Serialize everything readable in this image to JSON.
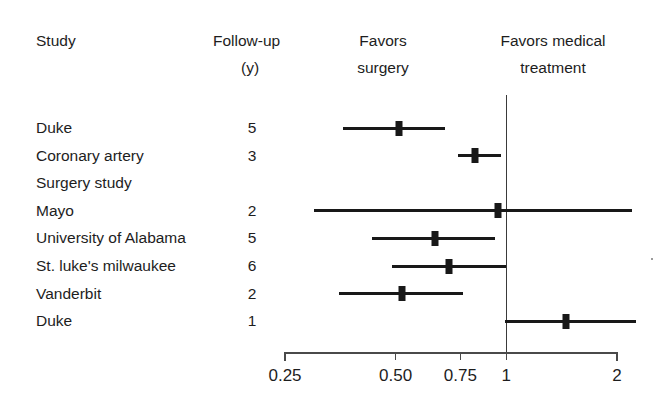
{
  "figure": {
    "title": "",
    "background_color": "#ffffff",
    "ink_color": "#181818"
  },
  "headers": {
    "study": "Study",
    "followup_line1": "Follow-up",
    "followup_line2": "(y)",
    "favors_surgery_line1": "Favors",
    "favors_surgery_line2": "surgery",
    "favors_medical_line1": "Favors medical",
    "favors_medical_line2": "treatment"
  },
  "chart_data": {
    "type": "forest",
    "title": "",
    "xlabel": "",
    "ylabel": "",
    "xscale": "log",
    "xlim": [
      0.25,
      2
    ],
    "grid": false,
    "reference_line": 1,
    "legend_position": "top",
    "left_annotation": "Favors surgery",
    "right_annotation": "Favors medical treatment",
    "xticks": [
      0.25,
      0.5,
      0.75,
      1,
      2
    ],
    "xticklabels": [
      "0.25",
      "0.50",
      "0.75",
      "1",
      "2"
    ],
    "columns": [
      "Study",
      "Follow-up (y)"
    ],
    "rows": [
      {
        "study": "Duke",
        "study_continuation": "",
        "followup": "5",
        "estimate": 0.51,
        "ci_low": 0.36,
        "ci_high": 0.68,
        "clipped_low": false,
        "clipped_high": false
      },
      {
        "study": "Coronary artery",
        "study_continuation": "Surgery study",
        "followup": "3",
        "estimate": 0.82,
        "ci_low": 0.74,
        "ci_high": 0.97,
        "clipped_low": false,
        "clipped_high": false
      },
      {
        "study": "Mayo",
        "study_continuation": "",
        "followup": "2",
        "estimate": 0.95,
        "ci_low": 0.3,
        "ci_high": 2.2,
        "clipped_low": true,
        "clipped_high": true
      },
      {
        "study": "University of Alabama",
        "study_continuation": "",
        "followup": "5",
        "estimate": 0.64,
        "ci_low": 0.43,
        "ci_high": 0.93,
        "clipped_low": false,
        "clipped_high": false
      },
      {
        "study": "St. luke's milwaukee",
        "study_continuation": "",
        "followup": "6",
        "estimate": 0.7,
        "ci_low": 0.49,
        "ci_high": 1.0,
        "clipped_low": false,
        "clipped_high": false
      },
      {
        "study": "Vanderbit",
        "study_continuation": "",
        "followup": "2",
        "estimate": 0.52,
        "ci_low": 0.35,
        "ci_high": 0.76,
        "clipped_low": false,
        "clipped_high": false
      },
      {
        "study": "Duke",
        "study_continuation": "",
        "followup": "1",
        "estimate": 1.45,
        "ci_low": 0.99,
        "ci_high": 2.25,
        "clipped_low": false,
        "clipped_high": true
      }
    ]
  }
}
